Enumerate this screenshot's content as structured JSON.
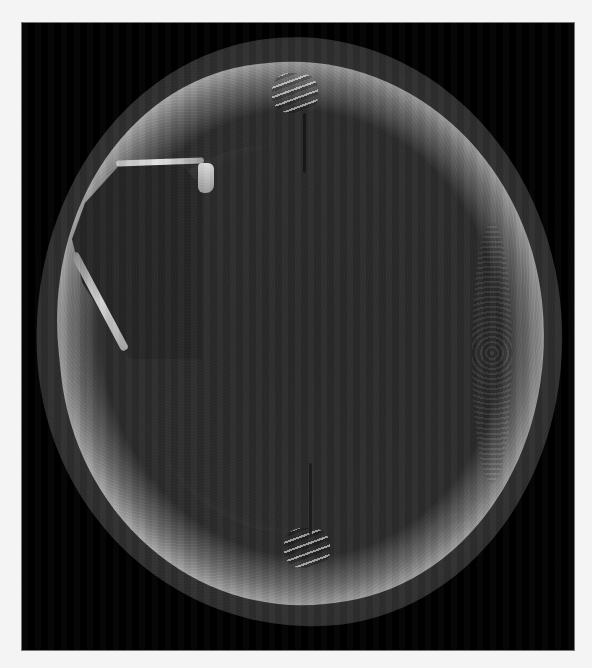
{
  "image": {
    "description": "Axial CT scan of the skull (bone window) showing a left frontal bone defect",
    "modality": "CT",
    "view": "axial",
    "background_color": "#f4f4f4",
    "frame_color": "#000000",
    "annotations": []
  }
}
